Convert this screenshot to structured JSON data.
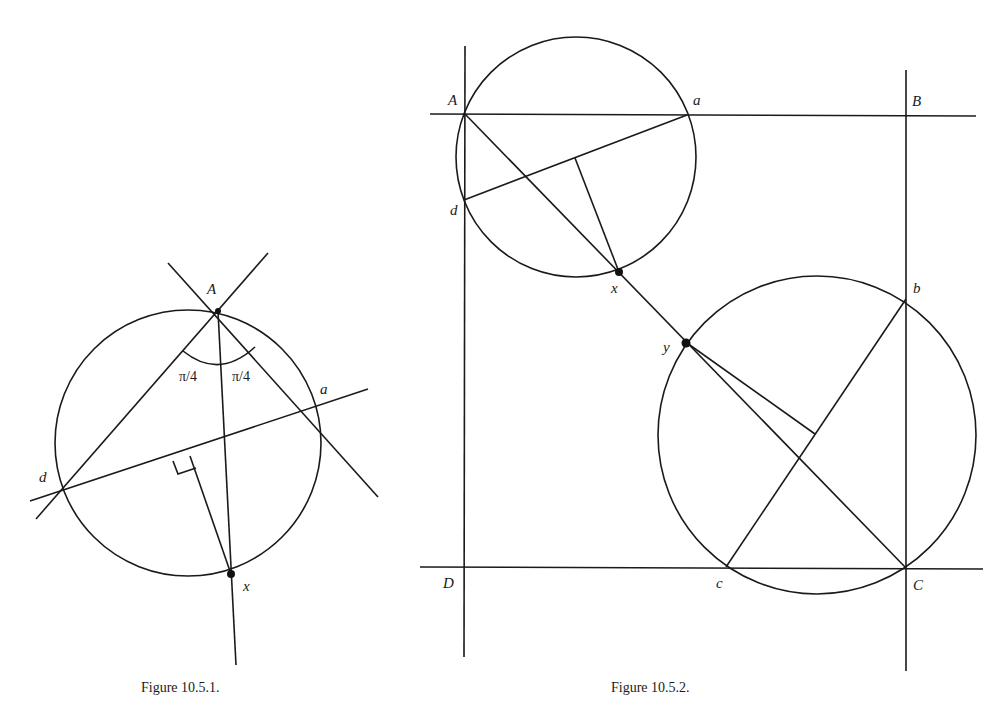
{
  "figure_1": {
    "caption": "Figure 10.5.1.",
    "labels": {
      "A": "A",
      "a": "a",
      "d": "d",
      "x": "x",
      "angle_left": "π/4",
      "angle_right": "π/4"
    }
  },
  "figure_2": {
    "caption": "Figure 10.5.2.",
    "labels": {
      "A": "A",
      "a": "a",
      "B": "B",
      "b": "b",
      "C": "C",
      "c": "c",
      "D": "D",
      "d": "d",
      "x": "x",
      "y": "y"
    }
  },
  "colors": {
    "ink": "#1a1a1a",
    "paper": "#ffffff"
  }
}
